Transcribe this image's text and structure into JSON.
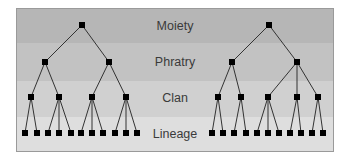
{
  "diagram": {
    "levels": [
      {
        "label": "Moiety",
        "color": "#b6b6b6"
      },
      {
        "label": "Phratry",
        "color": "#c2c2c2"
      },
      {
        "label": "Clan",
        "color": "#d0d0d0"
      },
      {
        "label": "Lineage",
        "color": "#dedede"
      }
    ],
    "trees": [
      {
        "name": "left-tree",
        "moiety": [
          82
        ],
        "phratry": [
          45,
          109
        ],
        "clan": [
          31,
          59,
          92,
          126
        ],
        "lineage": [
          25,
          37,
          48,
          59,
          71,
          81,
          92,
          103,
          115,
          126,
          137
        ],
        "clan_children": [
          [
            0,
            1
          ],
          [
            2,
            3,
            4
          ],
          [
            5,
            6,
            7
          ],
          [
            8,
            9,
            10
          ]
        ],
        "phratry_children": [
          [
            0,
            1
          ],
          [
            2,
            3
          ]
        ]
      },
      {
        "name": "right-tree",
        "moiety": [
          269
        ],
        "phratry": [
          232,
          297
        ],
        "clan": [
          218,
          241,
          268,
          297,
          318
        ],
        "lineage": [
          212,
          223,
          234,
          246,
          257,
          268,
          279,
          290,
          301,
          312,
          323
        ],
        "clan_children": [
          [
            0,
            1
          ],
          [
            2,
            3
          ],
          [
            4,
            5,
            6
          ],
          [
            7,
            8
          ],
          [
            9,
            10
          ]
        ],
        "phratry_children": [
          [
            0,
            1
          ],
          [
            2,
            3,
            4
          ]
        ]
      }
    ]
  }
}
